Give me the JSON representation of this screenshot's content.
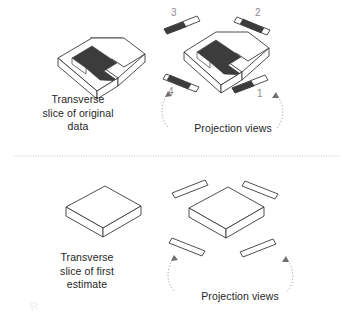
{
  "figure": {
    "background_color": "#ffffff",
    "line_color": "#3a3a3a",
    "dark_fill_color": "#3c3c3c",
    "light_fill_color": "#ffffff",
    "label_gray": "#8c8c8c",
    "divider": {
      "style": "dotted",
      "color": "#b9b9c4",
      "y": 156,
      "x_start": 14,
      "x_end": 340
    }
  },
  "panels": {
    "top": {
      "caption": "Transverse\nslice of original\ndata",
      "shape_name": "u-shaped-slab",
      "projection_caption": "Projection views",
      "projection_labels": [
        "1",
        "2",
        "3",
        "4"
      ],
      "projections": [
        {
          "label": "3",
          "position": "top-left",
          "tilt": "up-right",
          "fill": "dark-left"
        },
        {
          "label": "2",
          "position": "top-right",
          "tilt": "down-right",
          "fill": "dark-center"
        },
        {
          "label": "4",
          "position": "bottom-left",
          "tilt": "down-right",
          "fill": "dark-center"
        },
        {
          "label": "1",
          "position": "bottom-right",
          "tilt": "up-right",
          "fill": "dark-left"
        }
      ]
    },
    "bottom": {
      "caption": "Transverse\nslice of first\nestimate",
      "shape_name": "flat-slab",
      "projection_caption": "Projection views",
      "projection_labels": [],
      "projections": [
        {
          "label": "",
          "position": "top-left",
          "tilt": "up-right",
          "fill": "empty"
        },
        {
          "label": "",
          "position": "top-right",
          "tilt": "down-right",
          "fill": "empty"
        },
        {
          "label": "",
          "position": "bottom-left",
          "tilt": "down-right",
          "fill": "empty"
        },
        {
          "label": "",
          "position": "bottom-right",
          "tilt": "up-right",
          "fill": "empty"
        }
      ]
    }
  },
  "watermark": {
    "text": "R"
  }
}
